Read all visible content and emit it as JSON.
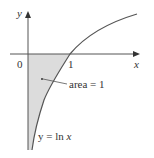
{
  "diagram": {
    "axes": {
      "x_label": "x",
      "y_label": "y",
      "origin_label": "0",
      "x_tick_label": "1"
    },
    "curve": {
      "equation_prefix": "y = ln ",
      "equation_var": "x",
      "color": "#555555"
    },
    "region": {
      "annotation": "area = 1",
      "fill": "#dcdcdc"
    },
    "colors": {
      "axis": "#555555",
      "text": "#333333"
    }
  }
}
